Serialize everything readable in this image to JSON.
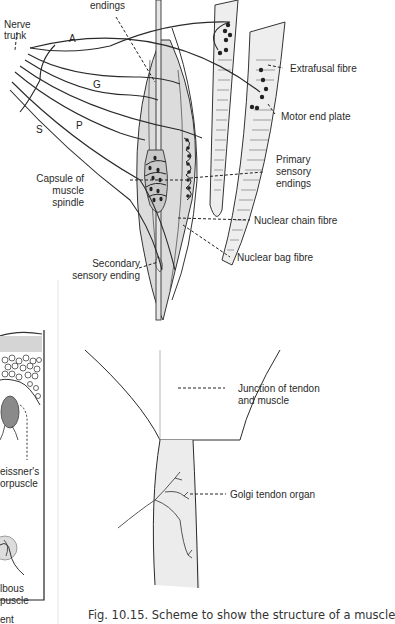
{
  "figure": {
    "caption": "Fig. 10.15. Scheme to show the structure of a muscle",
    "labels": {
      "endings": "endings",
      "nerve_trunk_1": "Nerve",
      "nerve_trunk_2": "trunk",
      "extrafusal_fibre": "Extrafusal fibre",
      "motor_end_plate": "Motor end plate",
      "primary_1": "Primary",
      "primary_2": "sensory",
      "primary_3": "endings",
      "capsule_1": "Capsule of",
      "capsule_2": "muscle",
      "capsule_3": "spindle",
      "nuclear_chain": "Nuclear chain fibre",
      "nuclear_bag": "Nuclear bag fibre",
      "secondary_1": "Secondary",
      "secondary_2": "sensory ending",
      "junction_1": "Junction of tendon",
      "junction_2": "and muscle",
      "golgi": "Golgi tendon organ",
      "meissner_1": "eissner's",
      "meissner_2": "orpuscle",
      "bulbous_1": "lbous",
      "bulbous_2": "puscle",
      "cut_text": "ent"
    },
    "nerve_letters": {
      "A": "A",
      "G": "G",
      "P": "P",
      "S": "S"
    },
    "colors": {
      "fill_gray": "#d9d9d9",
      "fibre_fill": "#eeeeee",
      "line": "#2a2a2a",
      "tendon_fill": "#ececec"
    }
  }
}
